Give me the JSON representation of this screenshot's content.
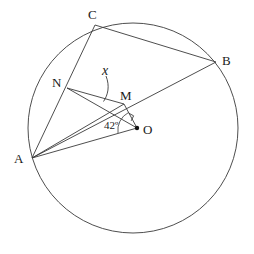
{
  "figure": {
    "type": "circle-geometry-diagram",
    "background_color": "#ffffff",
    "stroke_color": "#3a3a3a",
    "text_color": "#1a1a1a",
    "width": 254,
    "height": 254
  },
  "circle": {
    "name": "main-circle",
    "center_x": 133,
    "center_y": 128,
    "radius": 105
  },
  "points": {
    "A": {
      "label": "A",
      "x": 32,
      "y": 158,
      "label_x": 14,
      "label_y": 152,
      "on_circle": true,
      "dot": false
    },
    "B": {
      "label": "B",
      "x": 216,
      "y": 62,
      "label_x": 222,
      "label_y": 54,
      "on_circle": true,
      "dot": false
    },
    "C": {
      "label": "C",
      "x": 95,
      "y": 25,
      "label_x": 88,
      "label_y": 8,
      "on_circle": true,
      "dot": false
    },
    "N": {
      "label": "N",
      "x": 67,
      "y": 88,
      "label_x": 52,
      "label_y": 76,
      "on_circle": false,
      "dot": false
    },
    "M": {
      "label": "M",
      "x": 124,
      "y": 104,
      "label_x": 120,
      "label_y": 89,
      "on_circle": false,
      "dot": false
    },
    "O": {
      "label": "O",
      "x": 137,
      "y": 128,
      "label_x": 143,
      "label_y": 123,
      "on_circle": false,
      "dot": true
    }
  },
  "segments": [
    {
      "name": "segment-A-C",
      "from": "A",
      "to": "C"
    },
    {
      "name": "segment-C-B",
      "from": "C",
      "to": "B"
    },
    {
      "name": "segment-A-B",
      "from": "A",
      "to": "B"
    },
    {
      "name": "segment-N-M",
      "from": "N",
      "to": "M"
    },
    {
      "name": "segment-N-O",
      "from": "N",
      "to": "O"
    },
    {
      "name": "segment-M-O",
      "from": "M",
      "to": "O"
    },
    {
      "name": "segment-A-M",
      "from": "A",
      "to": "M"
    },
    {
      "name": "segment-A-O",
      "from": "A",
      "to": "O"
    }
  ],
  "annotations": {
    "angle_at_O": {
      "name": "angle-42-degrees",
      "text": "42º",
      "value": 42,
      "unit": "degrees",
      "label_x": 104,
      "label_y": 120
    },
    "unknown_angle": {
      "name": "angle-x",
      "text": "x",
      "label_x": 102,
      "label_y": 64,
      "leader_target_x": 103,
      "leader_target_y": 102
    },
    "right_angle_mark": {
      "name": "right-angle-mark-at-O",
      "present": true,
      "vertex": "O"
    }
  }
}
